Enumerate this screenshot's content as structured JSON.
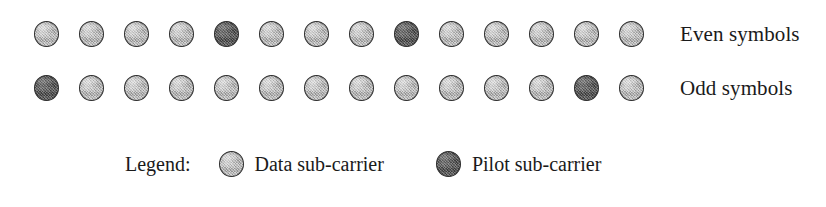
{
  "figure": {
    "type": "ofdm-subcarrier-allocation-diagram",
    "rows": [
      {
        "label": "Even symbols",
        "carrier_count": 14,
        "carriers": [
          "data",
          "data",
          "data",
          "data",
          "pilot",
          "data",
          "data",
          "data",
          "pilot",
          "data",
          "data",
          "data",
          "data",
          "data"
        ],
        "pilot_positions": [
          5,
          9
        ]
      },
      {
        "label": "Odd symbols",
        "carrier_count": 14,
        "carriers": [
          "pilot",
          "data",
          "data",
          "data",
          "data",
          "data",
          "data",
          "data",
          "data",
          "data",
          "data",
          "data",
          "pilot",
          "data"
        ],
        "pilot_positions": [
          1,
          13
        ]
      }
    ],
    "legend": {
      "title": "Legend:",
      "entries": [
        {
          "type": "data",
          "label": "Data sub-carrier"
        },
        {
          "type": "pilot",
          "label": "Pilot sub-carrier"
        }
      ]
    },
    "colors": {
      "data_fill": "#b3b3b3",
      "pilot_fill": "#585858",
      "outline": "#2e2e2e",
      "text": "#1a1a1a",
      "background": "#ffffff"
    }
  }
}
